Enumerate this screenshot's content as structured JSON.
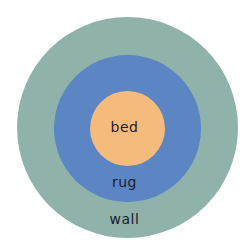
{
  "diagram": {
    "type": "concentric-circles",
    "layers": [
      {
        "label": "wall",
        "color": "#8fb3ab"
      },
      {
        "label": "rug",
        "color": "#5b86c3"
      },
      {
        "label": "bed",
        "color": "#f5bb7c"
      }
    ]
  }
}
